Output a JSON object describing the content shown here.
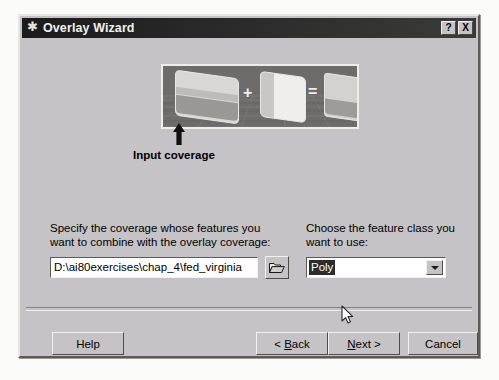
{
  "window": {
    "title": "Overlay Wizard",
    "icon": "asterisk-icon",
    "help_button": "?",
    "close_button": "X"
  },
  "illustration": {
    "name": "overlay-diagram",
    "plus_symbol": "+",
    "equals_symbol": "=",
    "arrow": "up-arrow",
    "caption": "Input coverage",
    "layers": [
      {
        "name": "input-coverage-layer"
      },
      {
        "name": "overlay-coverage-layer"
      },
      {
        "name": "result-coverage-layer"
      }
    ]
  },
  "fields": {
    "coverage": {
      "label": "Specify the coverage whose features you want to combine with the overlay coverage:",
      "value": "D:\\ai80exercises\\chap_4\\fed_virginia",
      "placeholder": "",
      "browse_icon": "open-folder-icon"
    },
    "feature_class": {
      "label": "Choose the feature class you want to use:",
      "value": "Poly",
      "options": [
        "Poly"
      ],
      "dropdown_icon": "chevron-down-icon"
    }
  },
  "buttons": {
    "help": "Help",
    "back": "< Back",
    "back_accel": "B",
    "next": "Next >",
    "next_accel": "N",
    "cancel": "Cancel"
  },
  "colors": {
    "dialog_face": "#c6c3c6",
    "titlebar": "#1b1b1b",
    "title_text": "#f2f0ec",
    "field_bg": "#ffffff",
    "selection_bg": "#2c2c2c",
    "panel_bg": "#6e6c6a"
  }
}
